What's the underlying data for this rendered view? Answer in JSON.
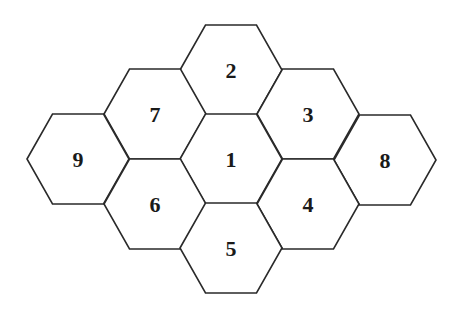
{
  "diagram": {
    "type": "hexagon-grid",
    "hex": {
      "half_width": 51,
      "half_height": 45
    },
    "stroke_color": "#2a2a2a",
    "label_color": "#1a1a1a",
    "cells": [
      {
        "id": "2",
        "label": "2",
        "cx": 231,
        "cy": 70
      },
      {
        "id": "7",
        "label": "7",
        "cx": 155,
        "cy": 114
      },
      {
        "id": "3",
        "label": "3",
        "cx": 308,
        "cy": 114
      },
      {
        "id": "9",
        "label": "9",
        "cx": 78,
        "cy": 159
      },
      {
        "id": "1",
        "label": "1",
        "cx": 231,
        "cy": 159
      },
      {
        "id": "8",
        "label": "8",
        "cx": 385,
        "cy": 160
      },
      {
        "id": "6",
        "label": "6",
        "cx": 155,
        "cy": 204
      },
      {
        "id": "4",
        "label": "4",
        "cx": 308,
        "cy": 204
      },
      {
        "id": "5",
        "label": "5",
        "cx": 231,
        "cy": 248
      }
    ]
  }
}
